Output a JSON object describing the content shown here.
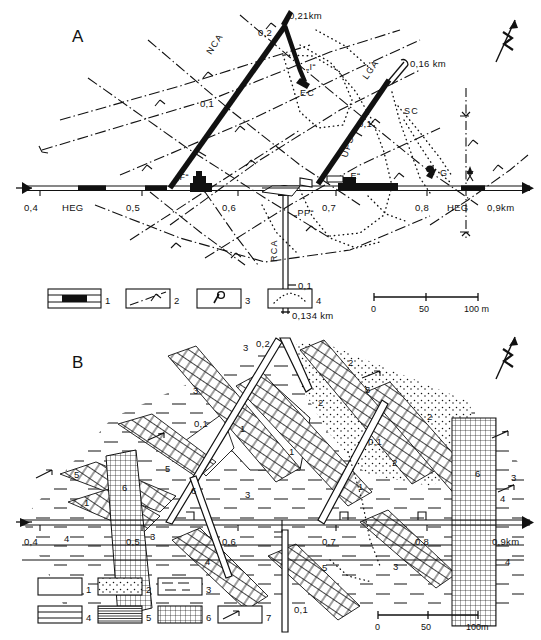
{
  "figure": {
    "panels": [
      {
        "letter": "A",
        "letter_pos": [
          72,
          42
        ],
        "north_arrow": {
          "name": "north-arrow",
          "label": "N",
          "pos": [
            505,
            38
          ]
        },
        "axis": {
          "name": "main-gallery-axis",
          "ticks": [
            {
              "label": "0,4",
              "x": 35
            },
            {
              "label": "0,5",
              "x": 137
            },
            {
              "label": "0,6",
              "x": 232
            },
            {
              "label": "0,7",
              "x": 330
            },
            {
              "label": "0,8",
              "x": 421
            },
            {
              "label": "0,9km",
              "x": 500
            }
          ],
          "markers": [
            {
              "label": "HEG",
              "x": 78
            },
            {
              "label": "HEG",
              "x": 468
            }
          ]
        },
        "gallery_labels": [
          {
            "text": "NCA",
            "x": 211,
            "y": 55,
            "rot": -57
          },
          {
            "text": "LCA",
            "x": 367,
            "y": 80,
            "rot": -55
          },
          {
            "text": "RCA",
            "x": 277,
            "y": 262,
            "rot": -90
          },
          {
            "text": "UPS",
            "x": 347,
            "y": 158,
            "rot": -72
          },
          {
            "text": "EC",
            "x": 308,
            "y": 96,
            "rot": 0
          },
          {
            "text": "SC",
            "x": 412,
            "y": 114,
            "rot": 0
          }
        ],
        "distance_labels": [
          {
            "text": "0,21km",
            "x": 289,
            "y": 19
          },
          {
            "text": "0,2",
            "x": 266,
            "y": 33
          },
          {
            "text": "0,16 km",
            "x": 397,
            "y": 67
          },
          {
            "text": "0,1",
            "x": 200,
            "y": 104
          },
          {
            "text": "0,1",
            "x": 356,
            "y": 124
          },
          {
            "text": "0,1",
            "x": 296,
            "y": 291
          },
          {
            "text": "0,134 km",
            "x": 296,
            "y": 318
          }
        ],
        "station_labels": [
          {
            "text": "„F“",
            "x": 185,
            "y": 180
          },
          {
            "text": "„I“",
            "x": 306,
            "y": 64
          },
          {
            "text": "„E“",
            "x": 320,
            "y": 175
          },
          {
            "text": "„PP“",
            "x": 300,
            "y": 211
          },
          {
            "text": "G",
            "x": 437,
            "y": 177
          }
        ],
        "legend": {
          "name": "legend-panel-a",
          "items": [
            {
              "num": "1",
              "kind": "mine-working-symbol"
            },
            {
              "num": "2",
              "kind": "fault-dashdot-symbol"
            },
            {
              "num": "3",
              "kind": "strike-dip-symbol"
            },
            {
              "num": "4",
              "kind": "dotted-boundary-symbol"
            }
          ]
        },
        "scalebar": {
          "name": "scalebar-panel-a",
          "ticks": [
            "0",
            "50",
            "100 m"
          ]
        }
      },
      {
        "letter": "B",
        "letter_pos": [
          72,
          368
        ],
        "north_arrow": {
          "name": "north-arrow",
          "label": "N",
          "pos": [
            505,
            355
          ]
        },
        "axis": {
          "name": "main-gallery-axis",
          "ticks": [
            {
              "label": "0,4",
              "x": 35
            },
            {
              "label": "0,5",
              "x": 137
            },
            {
              "label": "0,6",
              "x": 232
            },
            {
              "label": "0,7",
              "x": 330
            },
            {
              "label": "0,8",
              "x": 421
            },
            {
              "label": "0,9km",
              "x": 500
            }
          ]
        },
        "distance_labels": [
          {
            "text": "0,2",
            "x": 262,
            "y": 344
          },
          {
            "text": "0,1",
            "x": 198,
            "y": 424
          },
          {
            "text": "0,1",
            "x": 372,
            "y": 442
          },
          {
            "text": "0,1",
            "x": 296,
            "y": 610
          }
        ],
        "area_numbers": [
          {
            "text": "3",
            "x": 243,
            "y": 351
          },
          {
            "text": "3",
            "x": 193,
            "y": 394
          },
          {
            "text": "2",
            "x": 348,
            "y": 366
          },
          {
            "text": "5",
            "x": 365,
            "y": 393
          },
          {
            "text": "2",
            "x": 318,
            "y": 406
          },
          {
            "text": "2",
            "x": 427,
            "y": 420
          },
          {
            "text": "1",
            "x": 240,
            "y": 432
          },
          {
            "text": "1",
            "x": 289,
            "y": 455
          },
          {
            "text": "2",
            "x": 392,
            "y": 466
          },
          {
            "text": "5",
            "x": 74,
            "y": 478
          },
          {
            "text": "5",
            "x": 165,
            "y": 472
          },
          {
            "text": "6",
            "x": 122,
            "y": 491
          },
          {
            "text": "6",
            "x": 191,
            "y": 494
          },
          {
            "text": "6",
            "x": 475,
            "y": 477
          },
          {
            "text": "3",
            "x": 245,
            "y": 498
          },
          {
            "text": "1",
            "x": 358,
            "y": 490
          },
          {
            "text": "1",
            "x": 84,
            "y": 506
          },
          {
            "text": "3",
            "x": 511,
            "y": 481
          },
          {
            "text": "4",
            "x": 500,
            "y": 502
          },
          {
            "text": "4",
            "x": 64,
            "y": 542
          },
          {
            "text": "3",
            "x": 150,
            "y": 540
          },
          {
            "text": "4",
            "x": 205,
            "y": 565
          },
          {
            "text": "5",
            "x": 322,
            "y": 571
          },
          {
            "text": "3",
            "x": 393,
            "y": 570
          },
          {
            "text": "4",
            "x": 505,
            "y": 565
          }
        ],
        "legend": {
          "name": "legend-panel-b",
          "items": [
            {
              "num": "1",
              "kind": "blank-box"
            },
            {
              "num": "2",
              "kind": "stipple-box"
            },
            {
              "num": "3",
              "kind": "dash-box"
            },
            {
              "num": "4",
              "kind": "two-line-box"
            },
            {
              "num": "5",
              "kind": "hatch-lines-box"
            },
            {
              "num": "6",
              "kind": "grid-box"
            },
            {
              "num": "7",
              "kind": "arrow-box"
            }
          ]
        },
        "scalebar": {
          "name": "scalebar-panel-b",
          "ticks": [
            "0",
            "50",
            "100m"
          ]
        }
      }
    ]
  },
  "colors": {
    "ink": "#111111",
    "paper": "#ffffff"
  }
}
